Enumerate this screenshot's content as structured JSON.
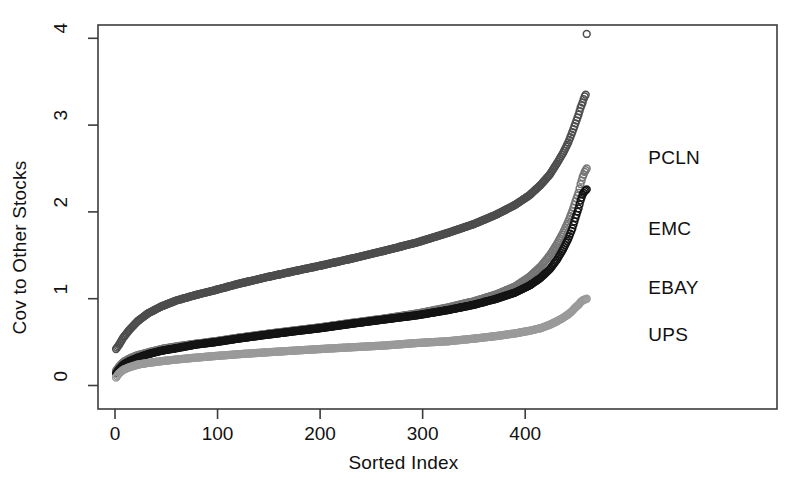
{
  "chart_data": {
    "type": "line",
    "title": "",
    "subtitle": "",
    "xlabel": "Sorted Index",
    "ylabel": "Cov to Other Stocks",
    "xlim": [
      -12,
      472
    ],
    "ylim": [
      -0.22,
      4.25
    ],
    "xticks": [
      0,
      100,
      200,
      300,
      400
    ],
    "xtick_labels": [
      "0",
      "100",
      "200",
      "300",
      "400"
    ],
    "yticks": [
      0,
      1,
      2,
      3,
      4
    ],
    "ytick_labels": [
      "0",
      "1",
      "2",
      "3",
      "4"
    ],
    "grid": false,
    "legend_position": "inline-right-annotations",
    "marker": "open-circle",
    "n_points": 460,
    "annotations": [
      {
        "text": "PCLN",
        "x": 520,
        "y": 2.62
      },
      {
        "text": "EMC",
        "x": 520,
        "y": 1.8
      },
      {
        "text": "EBAY",
        "x": 520,
        "y": 1.12
      },
      {
        "text": "UPS",
        "x": 520,
        "y": 0.58
      }
    ],
    "series": [
      {
        "name": "PCLN",
        "color": "#4d4d4d",
        "x": [
          1,
          4,
          8,
          14,
          22,
          32,
          45,
          60,
          78,
          98,
          120,
          145,
          172,
          200,
          230,
          262,
          295,
          325,
          350,
          372,
          390,
          404,
          415,
          424,
          431,
          437,
          442,
          446,
          449,
          452,
          454,
          456,
          457,
          458,
          459,
          460
        ],
        "y": [
          0.42,
          0.47,
          0.55,
          0.64,
          0.74,
          0.83,
          0.91,
          0.98,
          1.04,
          1.1,
          1.17,
          1.24,
          1.31,
          1.38,
          1.46,
          1.55,
          1.65,
          1.76,
          1.86,
          1.97,
          2.08,
          2.19,
          2.31,
          2.43,
          2.56,
          2.68,
          2.8,
          2.92,
          3.02,
          3.12,
          3.2,
          3.26,
          3.3,
          3.33,
          3.35,
          4.05
        ]
      },
      {
        "name": "EMC",
        "color": "#767676",
        "x": [
          1,
          4,
          8,
          14,
          22,
          32,
          45,
          60,
          78,
          98,
          120,
          145,
          172,
          200,
          230,
          262,
          295,
          325,
          350,
          372,
          390,
          404,
          415,
          424,
          431,
          437,
          442,
          446,
          449,
          452,
          454,
          456,
          458,
          460
        ],
        "y": [
          0.17,
          0.22,
          0.27,
          0.31,
          0.35,
          0.38,
          0.42,
          0.45,
          0.48,
          0.51,
          0.55,
          0.59,
          0.63,
          0.67,
          0.72,
          0.77,
          0.83,
          0.9,
          0.97,
          1.05,
          1.14,
          1.25,
          1.37,
          1.5,
          1.63,
          1.76,
          1.89,
          2.01,
          2.12,
          2.22,
          2.32,
          2.4,
          2.46,
          2.5
        ]
      },
      {
        "name": "EBAY",
        "color": "#141414",
        "x": [
          1,
          4,
          8,
          14,
          22,
          32,
          45,
          60,
          78,
          98,
          120,
          145,
          172,
          200,
          230,
          262,
          295,
          325,
          350,
          372,
          390,
          404,
          415,
          424,
          431,
          437,
          442,
          446,
          449,
          452,
          454,
          456,
          458,
          460
        ],
        "y": [
          0.14,
          0.19,
          0.24,
          0.28,
          0.32,
          0.36,
          0.4,
          0.43,
          0.47,
          0.5,
          0.54,
          0.58,
          0.62,
          0.66,
          0.71,
          0.76,
          0.81,
          0.87,
          0.93,
          1.0,
          1.07,
          1.15,
          1.24,
          1.34,
          1.45,
          1.57,
          1.69,
          1.81,
          1.93,
          2.04,
          2.13,
          2.2,
          2.24,
          2.26
        ]
      },
      {
        "name": "UPS",
        "color": "#9a9a9a",
        "x": [
          1,
          4,
          8,
          14,
          22,
          32,
          45,
          60,
          78,
          98,
          120,
          145,
          172,
          200,
          230,
          262,
          295,
          325,
          350,
          372,
          390,
          404,
          415,
          424,
          431,
          437,
          442,
          446,
          449,
          452,
          454,
          456,
          458,
          460
        ],
        "y": [
          0.09,
          0.14,
          0.18,
          0.21,
          0.24,
          0.26,
          0.28,
          0.3,
          0.32,
          0.34,
          0.36,
          0.38,
          0.4,
          0.42,
          0.44,
          0.46,
          0.49,
          0.51,
          0.54,
          0.57,
          0.6,
          0.63,
          0.66,
          0.7,
          0.74,
          0.78,
          0.82,
          0.86,
          0.9,
          0.93,
          0.96,
          0.98,
          0.99,
          1.0
        ]
      }
    ]
  }
}
